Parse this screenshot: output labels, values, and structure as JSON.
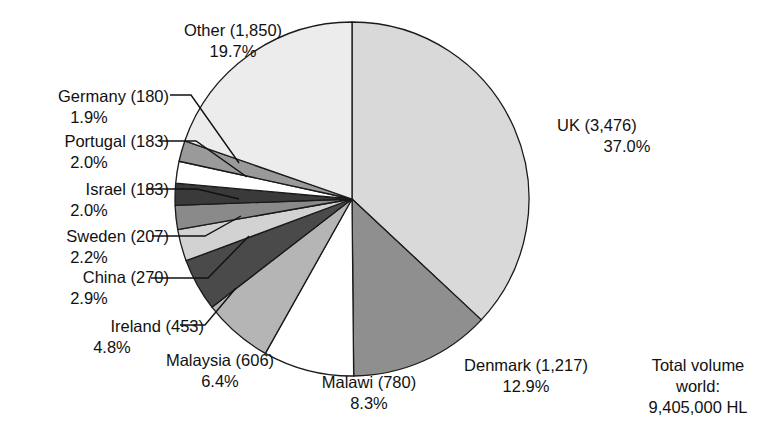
{
  "chart_data": {
    "type": "pie",
    "title": "",
    "legend_position": "callout-labels",
    "unit": "HL (thousands)",
    "total_label": {
      "line1": "Total volume",
      "line2": "world:",
      "line3": "9,405,000 HL"
    },
    "categories": [
      "UK",
      "Denmark",
      "Malawi",
      "Malaysia",
      "Ireland",
      "China",
      "Sweden",
      "Israel",
      "Portugal",
      "Germany",
      "Other"
    ],
    "values": [
      3476,
      1217,
      780,
      606,
      453,
      270,
      207,
      183,
      183,
      180,
      1850
    ],
    "percentages": [
      37.0,
      12.9,
      8.3,
      6.4,
      4.8,
      2.9,
      2.2,
      2.0,
      2.0,
      1.9,
      19.7
    ],
    "colors": [
      "#d9d9d9",
      "#8f8f8f",
      "#ffffff",
      "#b5b5b5",
      "#4a4a4a",
      "#d2d2d2",
      "#8a8a8a",
      "#3a3a3a",
      "#ffffff",
      "#9a9a9a",
      "#ececec"
    ],
    "slices": [
      {
        "name": "UK",
        "value": 3476,
        "value_text": "3,476",
        "percent_text": "37.0%",
        "percent": 37.0,
        "color": "#d9d9d9",
        "label_line1": "UK (3,476)",
        "label_line2": "37.0%"
      },
      {
        "name": "Denmark",
        "value": 1217,
        "value_text": "1,217",
        "percent_text": "12.9%",
        "percent": 12.9,
        "color": "#8f8f8f",
        "label_line1": "Denmark (1,217)",
        "label_line2": "12.9%"
      },
      {
        "name": "Malawi",
        "value": 780,
        "value_text": "780",
        "percent_text": "8.3%",
        "percent": 8.3,
        "color": "#ffffff",
        "label_line1": "Malawi (780)",
        "label_line2": "8.3%"
      },
      {
        "name": "Malaysia",
        "value": 606,
        "value_text": "606",
        "percent_text": "6.4%",
        "percent": 6.4,
        "color": "#b5b5b5",
        "label_line1": "Malaysia (606)",
        "label_line2": "6.4%"
      },
      {
        "name": "Ireland",
        "value": 453,
        "value_text": "453",
        "percent_text": "4.8%",
        "percent": 4.8,
        "color": "#4a4a4a",
        "label_line1": "Ireland (453)",
        "label_line2": "4.8%"
      },
      {
        "name": "China",
        "value": 270,
        "value_text": "270",
        "percent_text": "2.9%",
        "percent": 2.9,
        "color": "#d2d2d2",
        "label_line1": "China (270)",
        "label_line2": "2.9%"
      },
      {
        "name": "Sweden",
        "value": 207,
        "value_text": "207",
        "percent_text": "2.2%",
        "percent": 2.2,
        "color": "#8a8a8a",
        "label_line1": "Sweden (207)",
        "label_line2": "2.2%"
      },
      {
        "name": "Israel",
        "value": 183,
        "value_text": "183",
        "percent_text": "2.0%",
        "percent": 2.0,
        "color": "#3a3a3a",
        "label_line1": "Israel (183)",
        "label_line2": "2.0%"
      },
      {
        "name": "Portugal",
        "value": 183,
        "value_text": "183",
        "percent_text": "2.0%",
        "percent": 2.0,
        "color": "#ffffff",
        "label_line1": "Portugal (183)",
        "label_line2": "2.0%"
      },
      {
        "name": "Germany",
        "value": 180,
        "value_text": "180",
        "percent_text": "1.9%",
        "percent": 1.9,
        "color": "#9a9a9a",
        "label_line1": "Germany (180)",
        "label_line2": "1.9%"
      },
      {
        "name": "Other",
        "value": 1850,
        "value_text": "1,850",
        "percent_text": "19.7%",
        "percent": 19.7,
        "color": "#ececec",
        "label_line1": "Other (1,850)",
        "label_line2": "19.7%"
      }
    ]
  },
  "labels": {
    "other": {
      "line1": "Other (1,850)",
      "line2": "19.7%"
    },
    "germany": {
      "line1": "Germany (180)",
      "line2": "1.9%"
    },
    "portugal": {
      "line1": "Portugal (183)",
      "line2": "2.0%"
    },
    "israel": {
      "line1": "Israel (183)",
      "line2": "2.0%"
    },
    "sweden": {
      "line1": "Sweden (207)",
      "line2": "2.2%"
    },
    "china": {
      "line1": "China (270)",
      "line2": "2.9%"
    },
    "ireland": {
      "line1": "Ireland (453)",
      "line2": "4.8%"
    },
    "malaysia": {
      "line1": "Malaysia (606)",
      "line2": "6.4%"
    },
    "malawi": {
      "line1": "Malawi (780)",
      "line2": "8.3%"
    },
    "denmark": {
      "line1": "Denmark (1,217)",
      "line2": "12.9%"
    },
    "uk": {
      "line1": "UK (3,476)",
      "line2": "37.0%"
    },
    "total": {
      "line1": "Total volume",
      "line2": "world:",
      "line3": "9,405,000 HL"
    }
  }
}
